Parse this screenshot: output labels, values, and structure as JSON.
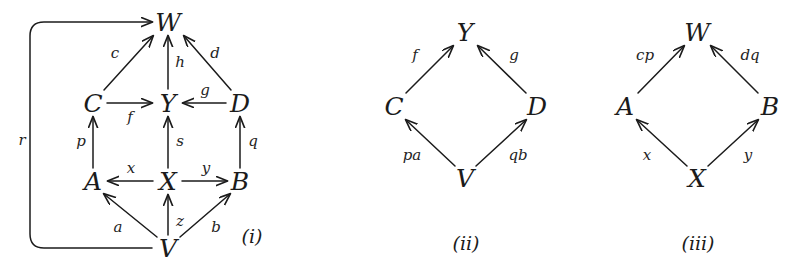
{
  "figure": {
    "background_color": "#ffffff",
    "ink_color": "#1b1b1b",
    "width": 806,
    "height": 270
  },
  "captions": [
    {
      "id": "caption-i",
      "text": "(i)",
      "x": 252,
      "y": 236
    },
    {
      "id": "caption-ii",
      "text": "(ii)",
      "x": 466,
      "y": 243
    },
    {
      "id": "caption-iii",
      "text": "(iii)",
      "x": 698,
      "y": 243
    }
  ],
  "diagrams": [
    {
      "id": "diagram-i",
      "caption": "(i)",
      "nodes": [
        {
          "id": "i-W",
          "label": "W",
          "x": 168,
          "y": 22
        },
        {
          "id": "i-C",
          "label": "C",
          "x": 93,
          "y": 103
        },
        {
          "id": "i-Y",
          "label": "Y",
          "x": 168,
          "y": 103
        },
        {
          "id": "i-D",
          "label": "D",
          "x": 240,
          "y": 103
        },
        {
          "id": "i-A",
          "label": "A",
          "x": 93,
          "y": 181
        },
        {
          "id": "i-X",
          "label": "X",
          "x": 168,
          "y": 181
        },
        {
          "id": "i-B",
          "label": "B",
          "x": 240,
          "y": 181
        },
        {
          "id": "i-V",
          "label": "V",
          "x": 168,
          "y": 248
        }
      ],
      "edges": [
        {
          "id": "i-edge-c",
          "label": "c",
          "from": "C",
          "to": "W",
          "label_x": 115,
          "label_y": 53
        },
        {
          "id": "i-edge-h",
          "label": "h",
          "from": "Y",
          "to": "W",
          "label_x": 180,
          "label_y": 62
        },
        {
          "id": "i-edge-d",
          "label": "d",
          "from": "D",
          "to": "W",
          "label_x": 215,
          "label_y": 53
        },
        {
          "id": "i-edge-f",
          "label": "f",
          "from": "C",
          "to": "Y",
          "label_x": 130,
          "label_y": 117
        },
        {
          "id": "i-edge-g",
          "label": "g",
          "from": "D",
          "to": "Y",
          "label_x": 205,
          "label_y": 90
        },
        {
          "id": "i-edge-p",
          "label": "p",
          "from": "A",
          "to": "C",
          "label_x": 81,
          "label_y": 141
        },
        {
          "id": "i-edge-s",
          "label": "s",
          "from": "X",
          "to": "Y",
          "label_x": 180,
          "label_y": 141
        },
        {
          "id": "i-edge-q",
          "label": "q",
          "from": "B",
          "to": "D",
          "label_x": 253,
          "label_y": 141
        },
        {
          "id": "i-edge-x",
          "label": "x",
          "from": "X",
          "to": "A",
          "label_x": 131,
          "label_y": 168
        },
        {
          "id": "i-edge-y",
          "label": "y",
          "from": "X",
          "to": "B",
          "label_x": 206,
          "label_y": 168
        },
        {
          "id": "i-edge-a",
          "label": "a",
          "from": "V",
          "to": "A",
          "label_x": 118,
          "label_y": 227
        },
        {
          "id": "i-edge-z",
          "label": "z",
          "from": "V",
          "to": "X",
          "label_x": 180,
          "label_y": 221
        },
        {
          "id": "i-edge-b",
          "label": "b",
          "from": "V",
          "to": "B",
          "label_x": 216,
          "label_y": 227
        },
        {
          "id": "i-edge-r",
          "label": "r",
          "from": "V",
          "to": "W",
          "label_x": 22,
          "label_y": 140,
          "style": "curved"
        }
      ]
    },
    {
      "id": "diagram-ii",
      "caption": "(ii)",
      "nodes": [
        {
          "id": "ii-Y",
          "label": "Y",
          "x": 465,
          "y": 32
        },
        {
          "id": "ii-C",
          "label": "C",
          "x": 394,
          "y": 106
        },
        {
          "id": "ii-D",
          "label": "D",
          "x": 537,
          "y": 106
        },
        {
          "id": "ii-V",
          "label": "V",
          "x": 465,
          "y": 178
        }
      ],
      "edges": [
        {
          "id": "ii-edge-f",
          "label": "f",
          "from": "C",
          "to": "Y",
          "label_x": 415,
          "label_y": 55
        },
        {
          "id": "ii-edge-g",
          "label": "g",
          "from": "D",
          "to": "Y",
          "label_x": 514,
          "label_y": 55
        },
        {
          "id": "ii-edge-pa",
          "label": "pa",
          "from": "V",
          "to": "C",
          "label_x": 412,
          "label_y": 155
        },
        {
          "id": "ii-edge-qb",
          "label": "qb",
          "from": "V",
          "to": "D",
          "label_x": 518,
          "label_y": 155
        }
      ]
    },
    {
      "id": "diagram-iii",
      "caption": "(iii)",
      "nodes": [
        {
          "id": "iii-W",
          "label": "W",
          "x": 697,
          "y": 32
        },
        {
          "id": "iii-A",
          "label": "A",
          "x": 625,
          "y": 106
        },
        {
          "id": "iii-B",
          "label": "B",
          "x": 770,
          "y": 106
        },
        {
          "id": "iii-X",
          "label": "X",
          "x": 697,
          "y": 178
        }
      ],
      "edges": [
        {
          "id": "iii-edge-cp",
          "label": "cp",
          "from": "A",
          "to": "W",
          "label_x": 645,
          "label_y": 55
        },
        {
          "id": "iii-edge-dq",
          "label": "dq",
          "from": "B",
          "to": "W",
          "label_x": 750,
          "label_y": 55
        },
        {
          "id": "iii-edge-x",
          "label": "x",
          "from": "X",
          "to": "A",
          "label_x": 647,
          "label_y": 155
        },
        {
          "id": "iii-edge-y",
          "label": "y",
          "from": "X",
          "to": "B",
          "label_x": 748,
          "label_y": 155
        }
      ]
    }
  ]
}
